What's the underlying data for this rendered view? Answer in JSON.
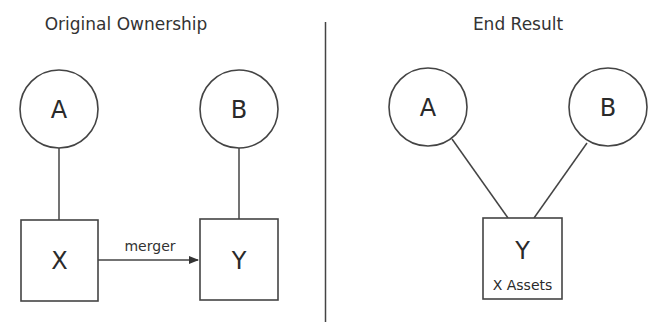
{
  "diagram": {
    "left_panel": {
      "title": "Original Ownership",
      "nodes": [
        {
          "id": "A",
          "label": "A",
          "shape": "circle"
        },
        {
          "id": "B",
          "label": "B",
          "shape": "circle"
        },
        {
          "id": "X",
          "label": "X",
          "shape": "square"
        },
        {
          "id": "Y",
          "label": "Y",
          "shape": "square"
        }
      ],
      "edges": [
        {
          "from": "A",
          "to": "X",
          "type": "line"
        },
        {
          "from": "B",
          "to": "Y",
          "type": "line"
        },
        {
          "from": "X",
          "to": "Y",
          "type": "arrow",
          "label": "merger"
        }
      ]
    },
    "right_panel": {
      "title": "End Result",
      "nodes": [
        {
          "id": "A",
          "label": "A",
          "shape": "circle"
        },
        {
          "id": "B",
          "label": "B",
          "shape": "circle"
        },
        {
          "id": "Y",
          "label": "Y",
          "sublabel": "X Assets",
          "shape": "square"
        }
      ],
      "edges": [
        {
          "from": "A",
          "to": "Y",
          "type": "line"
        },
        {
          "from": "B",
          "to": "Y",
          "type": "line"
        }
      ]
    }
  }
}
